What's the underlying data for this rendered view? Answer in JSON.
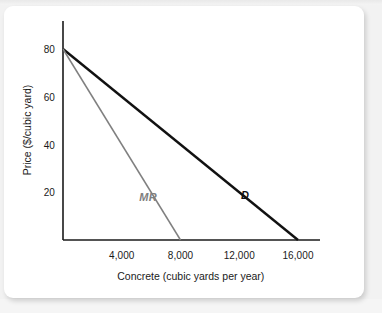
{
  "chart_data": {
    "type": "line",
    "title": "",
    "xlabel": "Concrete (cubic yards per year)",
    "ylabel": "Price ($/cubic yard)",
    "xlim": [
      0,
      17500
    ],
    "ylim": [
      0,
      90
    ],
    "xticks": [
      4000,
      8000,
      12000,
      16000
    ],
    "xtick_labels": [
      "4,000",
      "8,000",
      "12,000",
      "16,000"
    ],
    "yticks": [
      20,
      40,
      60,
      80
    ],
    "ytick_labels": [
      "20",
      "40",
      "60",
      "80"
    ],
    "grid": false,
    "legend_position": "inline-annotations",
    "series": [
      {
        "name": "D",
        "label": "D",
        "description": "Demand curve",
        "color": "#111111",
        "linewidth": 2.4,
        "x": [
          0,
          16000
        ],
        "y": [
          80,
          0
        ],
        "label_point": {
          "x": 12400,
          "y": 19
        },
        "intercepts": {
          "price": 80,
          "quantity": 16000
        }
      },
      {
        "name": "MR",
        "label": "MR",
        "description": "Marginal revenue curve",
        "color": "#808080",
        "linewidth": 1.5,
        "x": [
          0,
          8000
        ],
        "y": [
          80,
          0
        ],
        "label_point": {
          "x": 5800,
          "y": 18
        },
        "intercepts": {
          "price": 80,
          "quantity": 8000
        }
      }
    ],
    "axis_color": "#1a1a1a",
    "axis_linewidth": 1.6,
    "x_axis_extends_to": 17500
  },
  "figure": {
    "background_color": "#ffffff",
    "page_color": "#f2f2f2",
    "card_radius_px": 9
  }
}
